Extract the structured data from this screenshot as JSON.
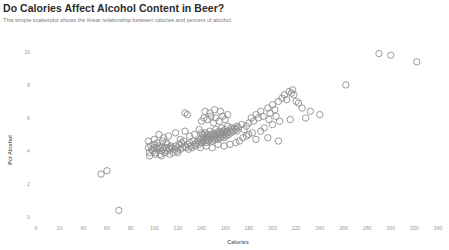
{
  "header": {
    "title": "Do Calories Affect Alcohol Content in Beer?",
    "subtitle": "This simple scatterplot shows the linear relationship between calories and percent of alcohol."
  },
  "colors": {
    "title": "#2b2b2b",
    "subtitle": "#7a7a7a",
    "point_stroke": "#8f8f8f",
    "tick_label": "#9a9a9a",
    "axis_title": "#6d6d6d",
    "background": "#ffffff"
  },
  "chart_data": {
    "type": "scatter",
    "title": "Do Calories Affect Alcohol Content in Beer?",
    "subtitle": "This simple scatterplot shows the linear relationship between calories and percent of alcohol.",
    "xlabel": "Calories",
    "ylabel": "Pct Alcohol",
    "xlim": [
      0,
      345
    ],
    "ylim": [
      0,
      10.6
    ],
    "xticks": [
      0,
      20,
      40,
      60,
      80,
      100,
      120,
      140,
      160,
      180,
      200,
      220,
      240,
      260,
      280,
      300,
      320,
      340
    ],
    "yticks": [
      0,
      2,
      4,
      6,
      8,
      10
    ],
    "xtick_labels": [
      "0",
      "20",
      "40",
      "60",
      "80",
      "100",
      "120",
      "140",
      "160",
      "180",
      "200",
      "220",
      "240",
      "260",
      "280",
      "300",
      "320",
      "340"
    ],
    "ytick_labels": [
      "0",
      "2",
      "4",
      "6",
      "8",
      "10"
    ],
    "grid": false,
    "legend": false,
    "marker": "open-circle",
    "marker_size": 3.2,
    "points": [
      [
        55,
        2.6
      ],
      [
        60,
        2.8
      ],
      [
        70,
        0.4
      ],
      [
        95,
        4.2
      ],
      [
        96,
        3.9
      ],
      [
        97,
        4.3
      ],
      [
        98,
        4.1
      ],
      [
        99,
        4.0
      ],
      [
        100,
        4.2
      ],
      [
        100,
        4.4
      ],
      [
        101,
        3.9
      ],
      [
        102,
        4.2
      ],
      [
        103,
        4.1
      ],
      [
        104,
        4.3
      ],
      [
        105,
        4.2
      ],
      [
        105,
        3.8
      ],
      [
        106,
        4.0
      ],
      [
        107,
        4.2
      ],
      [
        108,
        4.1
      ],
      [
        109,
        3.9
      ],
      [
        110,
        4.2
      ],
      [
        110,
        4.5
      ],
      [
        111,
        4.0
      ],
      [
        112,
        4.2
      ],
      [
        113,
        4.1
      ],
      [
        114,
        4.3
      ],
      [
        115,
        4.2
      ],
      [
        116,
        3.9
      ],
      [
        117,
        4.1
      ],
      [
        118,
        4.3
      ],
      [
        119,
        4.0
      ],
      [
        120,
        4.2
      ],
      [
        121,
        4.4
      ],
      [
        122,
        4.1
      ],
      [
        123,
        4.5
      ],
      [
        124,
        4.2
      ],
      [
        125,
        4.6
      ],
      [
        126,
        4.3
      ],
      [
        127,
        4.2
      ],
      [
        128,
        4.4
      ],
      [
        129,
        4.1
      ],
      [
        130,
        4.5
      ],
      [
        131,
        4.3
      ],
      [
        132,
        4.2
      ],
      [
        133,
        4.6
      ],
      [
        134,
        4.4
      ],
      [
        135,
        4.3
      ],
      [
        136,
        4.5
      ],
      [
        104,
        5.0
      ],
      [
        108,
        4.8
      ],
      [
        112,
        4.9
      ],
      [
        118,
        5.1
      ],
      [
        122,
        4.7
      ],
      [
        126,
        5.2
      ],
      [
        130,
        4.9
      ],
      [
        134,
        5.0
      ],
      [
        138,
        5.3
      ],
      [
        140,
        5.1
      ],
      [
        95,
        4.6
      ],
      [
        100,
        4.7
      ],
      [
        103,
        4.5
      ],
      [
        107,
        4.6
      ],
      [
        111,
        4.4
      ],
      [
        96,
        3.7
      ],
      [
        101,
        3.8
      ],
      [
        106,
        3.7
      ],
      [
        113,
        3.8
      ],
      [
        120,
        3.9
      ],
      [
        137,
        4.6
      ],
      [
        138,
        4.4
      ],
      [
        139,
        4.7
      ],
      [
        140,
        4.5
      ],
      [
        140,
        4.8
      ],
      [
        141,
        4.6
      ],
      [
        141,
        5.0
      ],
      [
        142,
        4.7
      ],
      [
        142,
        4.9
      ],
      [
        143,
        4.6
      ],
      [
        143,
        5.1
      ],
      [
        144,
        4.8
      ],
      [
        144,
        4.5
      ],
      [
        145,
        4.7
      ],
      [
        145,
        5.0
      ],
      [
        146,
        4.6
      ],
      [
        146,
        4.9
      ],
      [
        147,
        4.8
      ],
      [
        147,
        5.2
      ],
      [
        148,
        4.7
      ],
      [
        148,
        5.0
      ],
      [
        149,
        4.9
      ],
      [
        149,
        4.6
      ],
      [
        150,
        4.8
      ],
      [
        150,
        5.1
      ],
      [
        151,
        4.7
      ],
      [
        151,
        5.0
      ],
      [
        152,
        4.9
      ],
      [
        152,
        5.3
      ],
      [
        153,
        4.8
      ],
      [
        153,
        5.1
      ],
      [
        154,
        5.0
      ],
      [
        154,
        4.7
      ],
      [
        155,
        4.9
      ],
      [
        155,
        5.2
      ],
      [
        156,
        4.8
      ],
      [
        156,
        5.1
      ],
      [
        157,
        5.0
      ],
      [
        157,
        5.4
      ],
      [
        158,
        4.9
      ],
      [
        158,
        5.2
      ],
      [
        159,
        5.1
      ],
      [
        159,
        4.8
      ],
      [
        160,
        5.0
      ],
      [
        160,
        5.3
      ],
      [
        161,
        5.1
      ],
      [
        161,
        4.9
      ],
      [
        162,
        5.2
      ],
      [
        162,
        5.5
      ],
      [
        163,
        5.0
      ],
      [
        164,
        5.2
      ],
      [
        165,
        5.1
      ],
      [
        165,
        5.4
      ],
      [
        166,
        5.3
      ],
      [
        167,
        5.2
      ],
      [
        168,
        5.4
      ],
      [
        169,
        5.3
      ],
      [
        170,
        5.5
      ],
      [
        170,
        5.2
      ],
      [
        171,
        5.4
      ],
      [
        140,
        5.8
      ],
      [
        142,
        6.0
      ],
      [
        145,
        5.9
      ],
      [
        148,
        6.1
      ],
      [
        150,
        5.7
      ],
      [
        152,
        6.0
      ],
      [
        155,
        5.8
      ],
      [
        158,
        6.1
      ],
      [
        160,
        5.9
      ],
      [
        162,
        6.2
      ],
      [
        143,
        6.4
      ],
      [
        147,
        6.3
      ],
      [
        151,
        6.5
      ],
      [
        156,
        6.4
      ],
      [
        126,
        6.3
      ],
      [
        128,
        6.2
      ],
      [
        139,
        4.2
      ],
      [
        144,
        4.3
      ],
      [
        149,
        4.2
      ],
      [
        154,
        4.4
      ],
      [
        159,
        4.3
      ],
      [
        164,
        4.4
      ],
      [
        169,
        4.5
      ],
      [
        172,
        4.6
      ],
      [
        174,
        5.6
      ],
      [
        176,
        5.3
      ],
      [
        178,
        5.5
      ],
      [
        180,
        5.7
      ],
      [
        182,
        6.0
      ],
      [
        184,
        5.8
      ],
      [
        186,
        6.2
      ],
      [
        188,
        6.0
      ],
      [
        190,
        6.4
      ],
      [
        192,
        6.1
      ],
      [
        175,
        4.8
      ],
      [
        178,
        4.9
      ],
      [
        180,
        5.0
      ],
      [
        183,
        5.1
      ],
      [
        186,
        4.7
      ],
      [
        190,
        5.2
      ],
      [
        193,
        5.4
      ],
      [
        196,
        6.6
      ],
      [
        198,
        6.3
      ],
      [
        200,
        6.8
      ],
      [
        202,
        6.5
      ],
      [
        205,
        7.0
      ],
      [
        197,
        5.9
      ],
      [
        200,
        5.6
      ],
      [
        203,
        6.1
      ],
      [
        206,
        5.8
      ],
      [
        208,
        7.2
      ],
      [
        210,
        7.4
      ],
      [
        212,
        7.1
      ],
      [
        214,
        7.6
      ],
      [
        216,
        7.5
      ],
      [
        217,
        7.7
      ],
      [
        218,
        7.4
      ],
      [
        220,
        7.0
      ],
      [
        222,
        6.9
      ],
      [
        225,
        6.6
      ],
      [
        196,
        4.8
      ],
      [
        205,
        4.6
      ],
      [
        215,
        5.9
      ],
      [
        228,
        6.0
      ],
      [
        232,
        6.4
      ],
      [
        240,
        6.2
      ],
      [
        262,
        8.0
      ],
      [
        290,
        9.9
      ],
      [
        300,
        9.8
      ],
      [
        322,
        9.4
      ]
    ]
  }
}
